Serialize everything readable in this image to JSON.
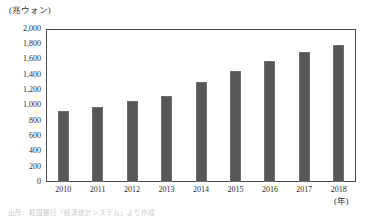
{
  "chart_data": {
    "type": "bar",
    "title": "",
    "unit_label": "(兆ウォン)",
    "xlabel": "(年)",
    "ylabel": "",
    "categories": [
      "2010",
      "2011",
      "2012",
      "2013",
      "2014",
      "2015",
      "2016",
      "2017",
      "2018"
    ],
    "values": [
      930,
      980,
      1050,
      1120,
      1300,
      1450,
      1580,
      1700,
      1780
    ],
    "ylim": [
      0,
      2000
    ],
    "y_ticks": [
      0,
      200,
      400,
      600,
      800,
      1000,
      1200,
      1400,
      1600,
      1800,
      2000
    ],
    "y_tick_labels": [
      "0",
      "200",
      "400",
      "600",
      "800",
      "1,000",
      "1,200",
      "1,400",
      "1,600",
      "1,800",
      "2,000"
    ],
    "grid": false,
    "legend": "none",
    "bar_color": "#575757",
    "frame_color": "#4a4a4a",
    "background": "#ffffff"
  },
  "footnote": {
    "text": "出所：韓国銀行「経済統計システム」より作成"
  }
}
